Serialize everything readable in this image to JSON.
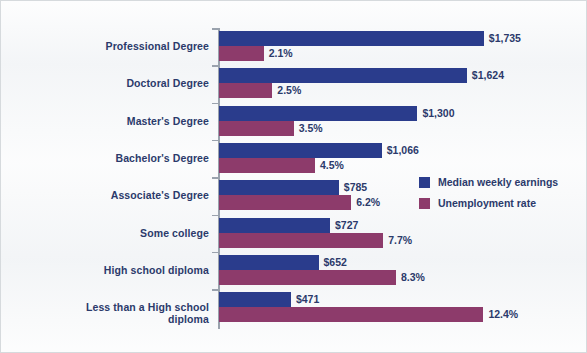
{
  "chart_data": {
    "type": "bar",
    "orientation": "horizontal",
    "title": "",
    "subtitle": "",
    "xlabel": "",
    "ylabel": "",
    "grid": false,
    "legend_position": "middle-right",
    "categories": [
      "Professional Degree",
      "Doctoral Degree",
      "Master's Degree",
      "Bachelor's Degree",
      "Associate's Degree",
      "Some college",
      "High school diploma",
      "Less than a High school\ndiploma"
    ],
    "series": [
      {
        "name": "Median weekly earnings",
        "color": "#2a3c8c",
        "values": [
          1735,
          1624,
          1300,
          1066,
          785,
          727,
          652,
          471
        ],
        "labels": [
          "$1,735",
          "$1,624",
          "$1,300",
          "$1,066",
          "$785",
          "$727",
          "$652",
          "$471"
        ],
        "axis_max": 1900
      },
      {
        "name": "Unemployment rate",
        "color": "#8d3b6b",
        "values": [
          2.1,
          2.5,
          3.5,
          4.5,
          6.2,
          7.7,
          8.3,
          12.4
        ],
        "labels": [
          "2.1%",
          "2.5%",
          "3.5%",
          "4.5%",
          "6.2%",
          "7.7%",
          "8.3%",
          "12.4%"
        ],
        "axis_max": 13.6
      }
    ]
  },
  "legend": {
    "items": [
      {
        "label": "Median weekly earnings",
        "color": "#2a3c8c"
      },
      {
        "label": "Unemployment rate",
        "color": "#8d3b6b"
      }
    ]
  },
  "colors": {
    "earnings": "#2a3c8c",
    "unemployment": "#8d3b6b",
    "text": "#2b3a6b",
    "background": "#f2f4f6",
    "axis": "#9aa2ad"
  }
}
